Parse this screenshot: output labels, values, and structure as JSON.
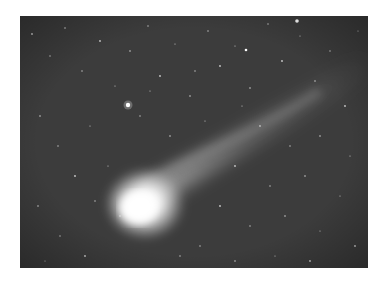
{
  "image": {
    "subject": "Comet with long tail against a dense star field",
    "alt": "Grayscale astrophotograph of a bright comet with a tail extending to the upper right across a starfield",
    "colors": {
      "background": "#ffffff",
      "sky": "#3a3a3a",
      "coma": "#ffffff"
    }
  }
}
